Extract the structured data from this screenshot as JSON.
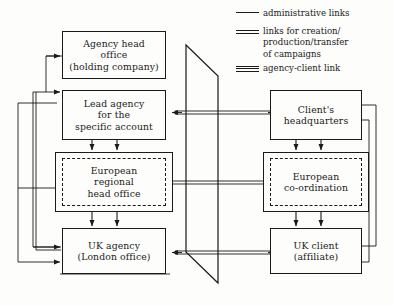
{
  "diagram": {
    "background_color": "#fdfdfb",
    "line_color": "#1a1a1a"
  },
  "legend": {
    "items": [
      {
        "icon": "single-line-icon",
        "rules": 1,
        "lines": [
          "administrative links"
        ]
      },
      {
        "icon": "double-line-icon",
        "rules": 2,
        "lines": [
          "links for creation/",
          "production/transfer",
          "of campaigns"
        ]
      },
      {
        "icon": "triple-line-icon",
        "rules": 3,
        "lines": [
          "agency-client link"
        ]
      }
    ]
  },
  "agency_side": {
    "nodes": [
      {
        "id": "agency-head-office",
        "border": "solid",
        "lines": [
          "Agency head",
          "office",
          "(holding company)"
        ]
      },
      {
        "id": "lead-agency",
        "border": "solid",
        "lines": [
          "Lead agency",
          "for the",
          "specific account"
        ]
      },
      {
        "id": "european-regional-head-office",
        "border": "dashed-in-solid",
        "lines": [
          "European",
          "regional",
          "head office"
        ]
      },
      {
        "id": "uk-agency",
        "border": "solid",
        "lines": [
          "UK agency",
          "(London office)"
        ]
      }
    ]
  },
  "client_side": {
    "nodes": [
      {
        "id": "clients-headquarters",
        "border": "solid",
        "lines": [
          "Client's",
          "headquarters"
        ]
      },
      {
        "id": "european-co-ordination",
        "border": "dashed-in-solid",
        "lines": [
          "European",
          "co-ordination"
        ]
      },
      {
        "id": "uk-client",
        "border": "solid",
        "lines": [
          "UK client",
          "(affiliate)"
        ]
      }
    ]
  },
  "boundary": {
    "id": "agency-client-boundary",
    "shape": "parallelogram"
  }
}
